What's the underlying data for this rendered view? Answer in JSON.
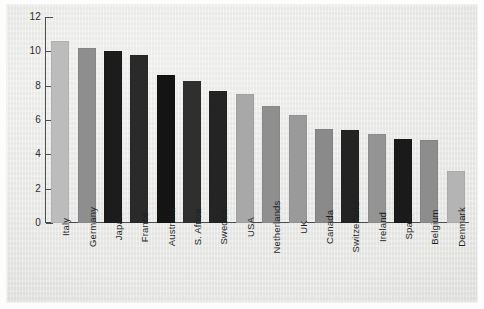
{
  "chart_data": {
    "type": "bar",
    "title": "",
    "subtitle": "",
    "xlabel": "",
    "ylabel": "",
    "ylim": [
      0,
      12
    ],
    "yticks": [
      0,
      2,
      4,
      6,
      8,
      10,
      12
    ],
    "ytick_labels": [
      "0",
      "2",
      "4",
      "6",
      "8",
      "10",
      "12"
    ],
    "grid": false,
    "legend": "none",
    "categories": [
      "Italy",
      "Germany",
      "Japan",
      "France",
      "Australia",
      "S. Africa",
      "Sweden",
      "USA",
      "Netherlands",
      "UK",
      "Canada",
      "Switzerland",
      "Ireland",
      "Spain",
      "Belgium",
      "Denmark"
    ],
    "values": [
      10.6,
      10.2,
      10.0,
      9.8,
      8.6,
      8.3,
      7.7,
      7.5,
      6.8,
      6.3,
      5.5,
      5.4,
      5.2,
      4.9,
      4.85,
      3.05
    ],
    "bar_colors": [
      "#bcbcbc",
      "#8e8e8e",
      "#1c1c1c",
      "#2a2a2a",
      "#141414",
      "#2f2f2f",
      "#242424",
      "#a8a8a8",
      "#8f8f8f",
      "#9a9a9a",
      "#8a8a8a",
      "#232323",
      "#949494",
      "#1a1a1a",
      "#8d8d8d",
      "#b4b4b4"
    ]
  },
  "style": {
    "axis_color": "#4c4c4c",
    "text_color": "#1f1f1f",
    "panel_color": "#ebebe9"
  }
}
